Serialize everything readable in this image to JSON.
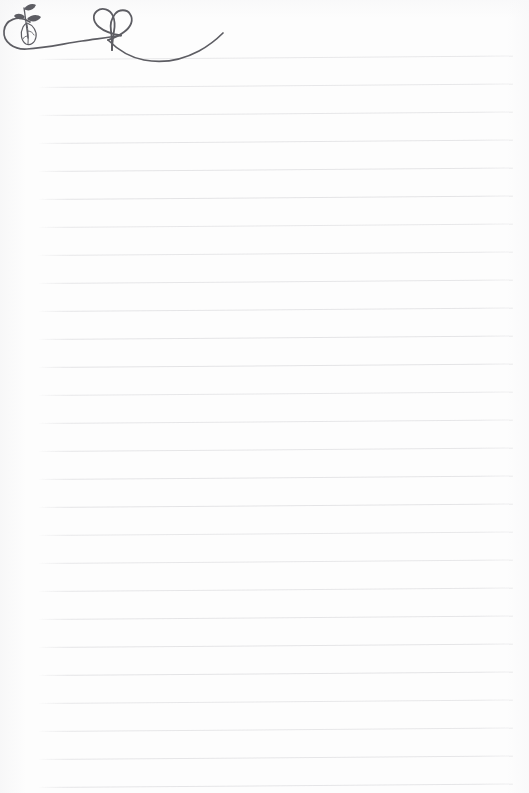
{
  "page": {
    "title": "Lined Notepaper Sheet",
    "width": 529,
    "height": 793,
    "background_color": "#fdfdfd",
    "paper_type": "ruled notepaper scan",
    "content_text": ""
  },
  "ruling": {
    "label": "Ruled Lines",
    "line_color": "#e3e3e5",
    "line_count": 27,
    "line_spacing_px": 28,
    "first_line_y": 59,
    "line_left_x": 38,
    "line_right_x": 513,
    "tilt_degrees": -0.42,
    "line_y_positions": [
      59,
      87,
      115,
      143,
      171,
      199,
      227,
      255,
      283,
      311,
      339,
      367,
      395,
      423,
      451,
      479,
      507,
      535,
      563,
      591,
      619,
      647,
      675,
      703,
      731,
      759,
      787
    ]
  },
  "doodle": {
    "label": "Hand-drawn flourish",
    "name": "heart-vine-flourish",
    "ink_color": "#5d5d63",
    "stroke_width": 1.6,
    "elements": [
      {
        "name": "circular-loop",
        "description": "open circular swirl at far left"
      },
      {
        "name": "sprout-stem",
        "description": "thin stem rising out of the loop"
      },
      {
        "name": "leaf-top-small",
        "description": "small filled leaf at top of stem"
      },
      {
        "name": "leaf-right-small",
        "description": "small filled leaf on right of stem"
      },
      {
        "name": "leaf-large-outline",
        "description": "larger outlined leaf with center vein"
      },
      {
        "name": "heart-loop",
        "description": "line crosses itself forming a heart"
      },
      {
        "name": "sweeping-tail",
        "description": "long S-curve sweeping right and up"
      }
    ],
    "bounds": {
      "x": 2,
      "y": 6,
      "width": 226,
      "height": 68
    }
  }
}
